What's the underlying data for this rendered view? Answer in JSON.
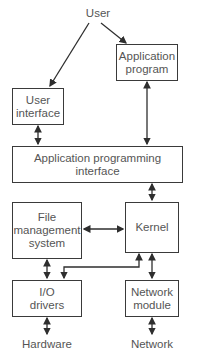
{
  "diagram": {
    "nodes": {
      "user": {
        "label": "User"
      },
      "application_program": {
        "line1": "Application",
        "line2": "program"
      },
      "user_interface": {
        "line1": "User",
        "line2": "interface"
      },
      "api": {
        "line1": "Application programming",
        "line2": "interface"
      },
      "file_management": {
        "line1": "File",
        "line2": "management",
        "line3": "system"
      },
      "kernel": {
        "label": "Kernel"
      },
      "io_drivers": {
        "line1": "I/O",
        "line2": "drivers"
      },
      "network_module": {
        "line1": "Network",
        "line2": "module"
      },
      "hardware": {
        "label": "Hardware"
      },
      "network": {
        "label": "Network"
      }
    },
    "edges": [
      {
        "from": "User",
        "to": "User interface",
        "type": "one-way"
      },
      {
        "from": "User",
        "to": "Application program",
        "type": "one-way"
      },
      {
        "from": "User interface",
        "to": "Application programming interface",
        "type": "two-way"
      },
      {
        "from": "Application program",
        "to": "Application programming interface",
        "type": "two-way"
      },
      {
        "from": "Application programming interface",
        "to": "Kernel",
        "type": "two-way"
      },
      {
        "from": "File management system",
        "to": "Kernel",
        "type": "two-way"
      },
      {
        "from": "File management system",
        "to": "I/O drivers",
        "type": "two-way"
      },
      {
        "from": "Kernel",
        "to": "I/O drivers",
        "type": "two-way"
      },
      {
        "from": "Kernel",
        "to": "Network module",
        "type": "two-way"
      },
      {
        "from": "I/O drivers",
        "to": "Hardware",
        "type": "two-way"
      },
      {
        "from": "Network module",
        "to": "Network",
        "type": "two-way"
      }
    ],
    "colors": {
      "line": "#2e2e2e",
      "text": "#555555"
    }
  }
}
